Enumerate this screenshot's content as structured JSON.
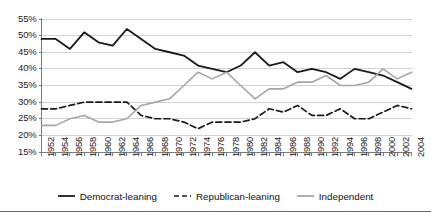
{
  "chart_data": {
    "type": "line",
    "title": "",
    "subtitle": "",
    "xlabel": "",
    "ylabel": "",
    "grid": true,
    "legend_position": "bottom",
    "xlim": [
      1952,
      2004
    ],
    "ylim": [
      15,
      55
    ],
    "ytick_step": 5,
    "ytick_labels": [
      "55%",
      "50%",
      "45%",
      "40%",
      "35%",
      "30%",
      "25%",
      "20%",
      "15%"
    ],
    "ytick_values": [
      55,
      50,
      45,
      40,
      35,
      30,
      25,
      20,
      15
    ],
    "categories": [
      1952,
      1954,
      1956,
      1958,
      1960,
      1962,
      1964,
      1966,
      1968,
      1970,
      1972,
      1974,
      1976,
      1978,
      1980,
      1982,
      1984,
      1986,
      1988,
      1990,
      1992,
      1994,
      1996,
      1998,
      2000,
      2002,
      2004
    ],
    "xtick_labels": [
      "1952",
      "1954",
      "1956",
      "1958",
      "1960",
      "1962",
      "1964",
      "1966",
      "1968",
      "1970",
      "1972",
      "1974",
      "1976",
      "1978",
      "1980",
      "1982",
      "1984",
      "1986",
      "1988",
      "1990",
      "1992",
      "1994",
      "1996",
      "1998",
      "2000",
      "2002",
      "2004"
    ],
    "series": [
      {
        "name": "Democrat-leaning",
        "style": "solid",
        "color": "#1a1a1a",
        "width": 1.8,
        "values": [
          49,
          49,
          46,
          51,
          48,
          47,
          52,
          49,
          46,
          45,
          44,
          41,
          40,
          39,
          41,
          45,
          41,
          42,
          39,
          40,
          39,
          37,
          40,
          39,
          38,
          36,
          34
        ]
      },
      {
        "name": "Republican-leaning",
        "style": "dashed",
        "color": "#1a1a1a",
        "width": 1.7,
        "values": [
          28,
          28,
          29,
          30,
          30,
          30,
          30,
          26,
          25,
          25,
          24,
          22,
          24,
          24,
          24,
          25,
          28,
          27,
          29,
          26,
          26,
          28,
          25,
          25,
          27,
          29,
          28
        ]
      },
      {
        "name": "Independent",
        "style": "solid",
        "color": "#a6a6a6",
        "width": 1.6,
        "values": [
          23,
          23,
          25,
          26,
          24,
          24,
          25,
          29,
          30,
          31,
          35,
          39,
          37,
          39,
          35,
          31,
          34,
          34,
          36,
          36,
          38,
          35,
          35,
          36,
          40,
          37,
          39
        ]
      }
    ]
  },
  "legend": {
    "items": [
      {
        "label": "Democrat-leaning",
        "style": "solid",
        "color": "#1a1a1a"
      },
      {
        "label": "Republican-leaning",
        "style": "dashed",
        "color": "#1a1a1a"
      },
      {
        "label": "Independent",
        "style": "solid",
        "color": "#a6a6a6"
      }
    ]
  },
  "colors": {
    "democrat": "#1a1a1a",
    "republican": "#1a1a1a",
    "independent": "#a6a6a6",
    "gridline": "#d2d2d2",
    "axis": "#7a7a7a",
    "background": "#ffffff",
    "text": "#1a1a1a"
  }
}
